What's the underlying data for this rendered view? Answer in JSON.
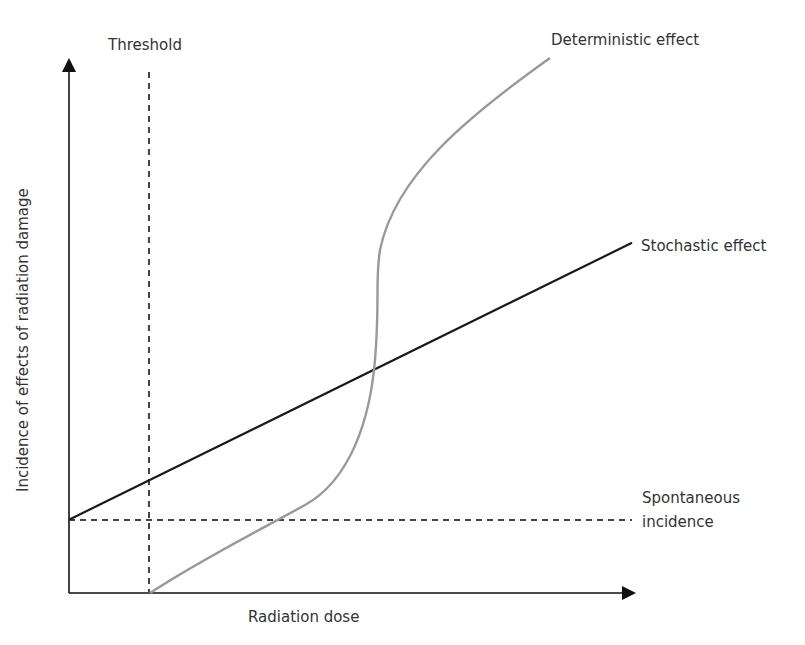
{
  "diagram": {
    "x_axis_label": "Radiation dose",
    "y_axis_label": "Incidence of effects of radiation damage",
    "labels": {
      "threshold": "Threshold",
      "deterministic": "Deterministic effect",
      "stochastic": "Stochastic effect",
      "spontaneous_line1": "Spontaneous",
      "spontaneous_line2": "incidence"
    },
    "colors": {
      "axis": "#111111",
      "stochastic": "#1a1a1a",
      "deterministic": "#999999",
      "dashed": "#444444",
      "text": "#333333"
    }
  },
  "chart_data": {
    "type": "line",
    "title": "",
    "xlabel": "Radiation dose",
    "ylabel": "Incidence of effects of radiation damage",
    "xlim": [
      0,
      1
    ],
    "ylim": [
      0,
      1
    ],
    "grid": false,
    "threshold_x": 0.14,
    "spontaneous_incidence_y": 0.135,
    "series": [
      {
        "name": "Stochastic effect",
        "style": "solid-dark",
        "points": [
          [
            0,
            0.135
          ],
          [
            1,
            0.645
          ]
        ]
      },
      {
        "name": "Deterministic effect",
        "style": "solid-grey",
        "points": [
          [
            0.14,
            0
          ],
          [
            0.33,
            0.14
          ],
          [
            0.42,
            0.3
          ],
          [
            0.53,
            0.44
          ],
          [
            0.54,
            0.6
          ],
          [
            0.55,
            0.64
          ],
          [
            0.63,
            0.78
          ],
          [
            0.84,
            0.96
          ]
        ]
      }
    ],
    "annotations": [
      "Threshold",
      "Spontaneous incidence"
    ]
  }
}
